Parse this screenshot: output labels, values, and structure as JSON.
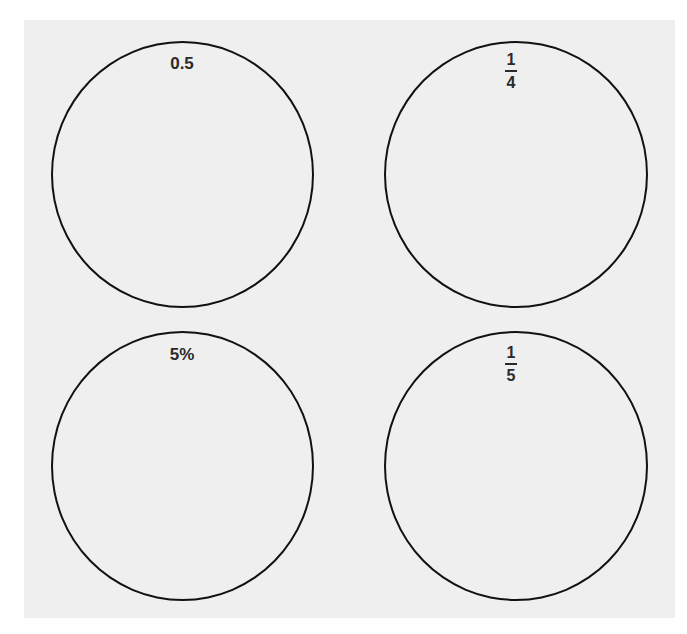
{
  "diagram": {
    "colors": {
      "panel_background": "#efefef",
      "circle_stroke": "#111111",
      "label_text": "#2a2a2a"
    },
    "circles": [
      {
        "position": "top-left",
        "label_type": "text",
        "label": "0.5"
      },
      {
        "position": "top-right",
        "label_type": "fraction",
        "numerator": "1",
        "denominator": "4"
      },
      {
        "position": "bottom-left",
        "label_type": "text",
        "label": "5%"
      },
      {
        "position": "bottom-right",
        "label_type": "fraction",
        "numerator": "1",
        "denominator": "5"
      }
    ]
  }
}
